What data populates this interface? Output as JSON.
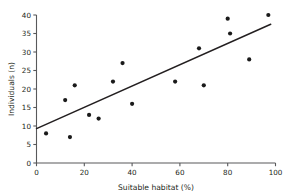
{
  "chart_data": {
    "type": "scatter",
    "title": "",
    "xlabel": "Suitable habitat (%)",
    "ylabel": "Individuals (n)",
    "xlim": [
      0,
      100
    ],
    "ylim": [
      0,
      40
    ],
    "xticks": [
      0,
      20,
      40,
      60,
      80,
      100
    ],
    "yticks": [
      0,
      5,
      10,
      15,
      20,
      25,
      30,
      35,
      40
    ],
    "xtick_labels": [
      "0",
      "20",
      "40",
      "60",
      "80",
      "100"
    ],
    "ytick_labels": [
      "0",
      "5",
      "10",
      "15",
      "20",
      "25",
      "30",
      "35",
      "40"
    ],
    "grid": false,
    "legend": null,
    "points": [
      {
        "x": 4,
        "y": 8
      },
      {
        "x": 12,
        "y": 17
      },
      {
        "x": 14,
        "y": 7
      },
      {
        "x": 16,
        "y": 21
      },
      {
        "x": 22,
        "y": 13
      },
      {
        "x": 26,
        "y": 12
      },
      {
        "x": 32,
        "y": 22
      },
      {
        "x": 36,
        "y": 27
      },
      {
        "x": 40,
        "y": 16
      },
      {
        "x": 58,
        "y": 22
      },
      {
        "x": 68,
        "y": 31
      },
      {
        "x": 70,
        "y": 21
      },
      {
        "x": 80,
        "y": 39
      },
      {
        "x": 81,
        "y": 35
      },
      {
        "x": 89,
        "y": 28
      },
      {
        "x": 97,
        "y": 40
      }
    ],
    "trendline": {
      "name": "linear fit",
      "x_start": 0,
      "y_start": 9.3,
      "x_end": 98,
      "y_end": 37.5
    },
    "colors": {
      "point": "#1a1a1a",
      "line": "#231f20",
      "axis": "#58595b",
      "text": "#231f20",
      "background": "#ffffff"
    }
  }
}
